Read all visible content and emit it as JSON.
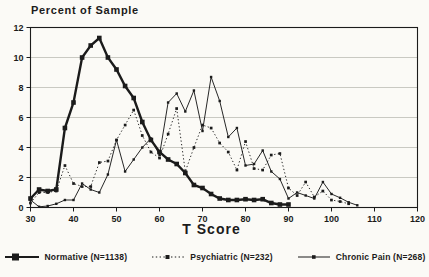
{
  "chart": {
    "title": "Percent of Sample",
    "x_label": "T Score",
    "x_ticks": [
      30,
      40,
      50,
      60,
      70,
      80,
      90,
      100,
      110,
      120
    ],
    "y_ticks": [
      0,
      2,
      4,
      6,
      8,
      10,
      12
    ],
    "x_range": [
      30,
      120
    ],
    "y_range": [
      0,
      12
    ],
    "ink_color": "#1b1b1b",
    "grid_color": "#c3c3bc"
  },
  "legend": {
    "items": [
      {
        "label": "Normative (N=1138)"
      },
      {
        "label": "Psychiatric (N=232)"
      },
      {
        "label": "Chronic Pain (N=268)"
      }
    ]
  },
  "chart_data": {
    "type": "line",
    "title": "Percent of Sample",
    "xlabel": "T Score",
    "ylabel": "Percent of Sample",
    "xlim": [
      30,
      120
    ],
    "ylim": [
      0,
      12
    ],
    "grid": "horizontal",
    "legend_position": "bottom",
    "series": [
      {
        "name": "Normative (N=1138)",
        "style": "thick-solid",
        "marker": "filled-square",
        "points": [
          [
            30,
            0.6
          ],
          [
            32,
            1.2
          ],
          [
            34,
            1.1
          ],
          [
            36,
            1.2
          ],
          [
            38,
            5.3
          ],
          [
            40,
            7.0
          ],
          [
            42,
            10.0
          ],
          [
            44,
            10.8
          ],
          [
            46,
            11.3
          ],
          [
            48,
            10.0
          ],
          [
            50,
            9.2
          ],
          [
            52,
            8.1
          ],
          [
            54,
            7.3
          ],
          [
            56,
            5.7
          ],
          [
            58,
            4.5
          ],
          [
            60,
            3.7
          ],
          [
            62,
            3.2
          ],
          [
            64,
            2.9
          ],
          [
            66,
            2.3
          ],
          [
            68,
            1.5
          ],
          [
            70,
            1.3
          ],
          [
            72,
            0.9
          ],
          [
            74,
            0.6
          ],
          [
            76,
            0.5
          ],
          [
            78,
            0.5
          ],
          [
            80,
            0.55
          ],
          [
            82,
            0.5
          ],
          [
            84,
            0.55
          ],
          [
            86,
            0.3
          ],
          [
            88,
            0.2
          ],
          [
            90,
            0.2
          ]
        ]
      },
      {
        "name": "Psychiatric (N=232)",
        "style": "dotted",
        "marker": "small-square",
        "points": [
          [
            30,
            0.3
          ],
          [
            32,
            1.0
          ],
          [
            34,
            1.0
          ],
          [
            36,
            1.1
          ],
          [
            38,
            2.8
          ],
          [
            40,
            1.6
          ],
          [
            42,
            1.4
          ],
          [
            44,
            1.4
          ],
          [
            46,
            3.0
          ],
          [
            48,
            3.1
          ],
          [
            50,
            4.5
          ],
          [
            52,
            5.5
          ],
          [
            54,
            6.5
          ],
          [
            56,
            4.8
          ],
          [
            58,
            3.7
          ],
          [
            60,
            3.3
          ],
          [
            62,
            4.9
          ],
          [
            64,
            6.6
          ],
          [
            66,
            2.4
          ],
          [
            68,
            4.0
          ],
          [
            70,
            5.5
          ],
          [
            72,
            5.3
          ],
          [
            74,
            4.3
          ],
          [
            76,
            3.7
          ],
          [
            78,
            2.5
          ],
          [
            80,
            4.4
          ],
          [
            82,
            2.6
          ],
          [
            84,
            2.5
          ],
          [
            86,
            3.5
          ],
          [
            88,
            3.6
          ],
          [
            90,
            1.3
          ],
          [
            92,
            0.8
          ],
          [
            94,
            1.7
          ],
          [
            96,
            0.7
          ],
          [
            98,
            1.1
          ],
          [
            100,
            0.5
          ],
          [
            102,
            0.4
          ],
          [
            104,
            0.25
          ]
        ]
      },
      {
        "name": "Chronic Pain (N=268)",
        "style": "thin-solid",
        "marker": "small-square",
        "points": [
          [
            30,
            0.5
          ],
          [
            32,
            0.05
          ],
          [
            34,
            0.1
          ],
          [
            36,
            0.25
          ],
          [
            38,
            0.5
          ],
          [
            40,
            0.5
          ],
          [
            42,
            1.6
          ],
          [
            44,
            1.2
          ],
          [
            46,
            1.0
          ],
          [
            48,
            2.2
          ],
          [
            50,
            4.5
          ],
          [
            52,
            2.4
          ],
          [
            54,
            3.2
          ],
          [
            56,
            4.0
          ],
          [
            58,
            4.6
          ],
          [
            60,
            3.5
          ],
          [
            62,
            7.0
          ],
          [
            64,
            7.6
          ],
          [
            66,
            6.4
          ],
          [
            68,
            7.8
          ],
          [
            70,
            5.1
          ],
          [
            72,
            8.7
          ],
          [
            74,
            7.1
          ],
          [
            76,
            4.7
          ],
          [
            78,
            5.3
          ],
          [
            80,
            2.8
          ],
          [
            82,
            2.9
          ],
          [
            84,
            3.8
          ],
          [
            86,
            2.4
          ],
          [
            88,
            1.9
          ],
          [
            90,
            0.6
          ],
          [
            92,
            1.0
          ],
          [
            94,
            0.8
          ],
          [
            96,
            0.6
          ],
          [
            98,
            1.7
          ],
          [
            100,
            0.9
          ],
          [
            102,
            0.65
          ],
          [
            104,
            0.35
          ],
          [
            106,
            0.15
          ]
        ]
      }
    ]
  }
}
